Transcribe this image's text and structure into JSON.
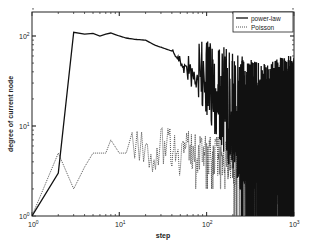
{
  "chart_data": {
    "type": "line",
    "title": "",
    "xlabel": "step",
    "ylabel": "degree of current node",
    "xscale": "log",
    "yscale": "log",
    "xlim": [
      1,
      1000
    ],
    "ylim": [
      1,
      200
    ],
    "x_ticks": [
      "10^0",
      "10^1",
      "10^2",
      "10^3"
    ],
    "y_ticks": [
      "10^0",
      "10^1",
      "10^2"
    ],
    "grid": false,
    "legend_position": "upper right",
    "series": [
      {
        "name": "power-law",
        "style": "solid",
        "color": "#111111",
        "points": [
          [
            1,
            1
          ],
          [
            2,
            3
          ],
          [
            3,
            110
          ],
          [
            4,
            105
          ],
          [
            5,
            107
          ],
          [
            6,
            100
          ],
          [
            7,
            105
          ],
          [
            8,
            108
          ],
          [
            10,
            100
          ],
          [
            12,
            95
          ],
          [
            15,
            92
          ],
          [
            20,
            90
          ],
          [
            25,
            80
          ],
          [
            30,
            75
          ],
          [
            40,
            68
          ],
          [
            50,
            60
          ],
          [
            60,
            52
          ],
          [
            80,
            45
          ],
          [
            100,
            38
          ],
          [
            150,
            28
          ],
          [
            200,
            20
          ],
          [
            300,
            14
          ],
          [
            500,
            12
          ],
          [
            700,
            15
          ],
          [
            1000,
            15
          ]
        ],
        "notes": "Becomes extremely noisy above step ~40, oscillating between ~1 and ~60 at large steps"
      },
      {
        "name": "Poisson",
        "style": "dotted",
        "color": "#555555",
        "points": [
          [
            1,
            1
          ],
          [
            2,
            5
          ],
          [
            3,
            2
          ],
          [
            4,
            3.5
          ],
          [
            5,
            5
          ],
          [
            7,
            5
          ],
          [
            8,
            7
          ],
          [
            10,
            5
          ],
          [
            12,
            5
          ],
          [
            14,
            8
          ],
          [
            17,
            7
          ],
          [
            20,
            7
          ],
          [
            22,
            4
          ],
          [
            25,
            5
          ],
          [
            30,
            6
          ],
          [
            35,
            8
          ],
          [
            40,
            6
          ],
          [
            50,
            5
          ],
          [
            60,
            6
          ],
          [
            80,
            5
          ],
          [
            100,
            5
          ],
          [
            150,
            5
          ],
          [
            200,
            4
          ],
          [
            300,
            3
          ],
          [
            500,
            3
          ],
          [
            1000,
            2
          ]
        ],
        "notes": "Fluctuates mostly between ~2 and ~10 after step 10"
      }
    ]
  },
  "axes": {
    "xlabel": "step",
    "ylabel": "degree of current node",
    "x_tick_base": "10",
    "x_tick_exps": [
      "0",
      "1",
      "2",
      "3"
    ],
    "y_tick_base": "10",
    "y_tick_exps": [
      "0",
      "1",
      "2"
    ]
  },
  "legend": {
    "items": [
      {
        "label": "power-law"
      },
      {
        "label": "Poisson"
      }
    ]
  }
}
